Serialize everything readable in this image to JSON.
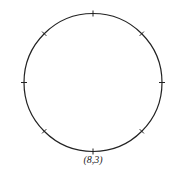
{
  "diagram": {
    "type": "circle-with-ticks",
    "caption": "(8,3)",
    "tick_count": 8,
    "center": [
      93,
      82.5
    ],
    "radius": 69,
    "stroke_color": "#222222",
    "background": "#ffffff"
  }
}
